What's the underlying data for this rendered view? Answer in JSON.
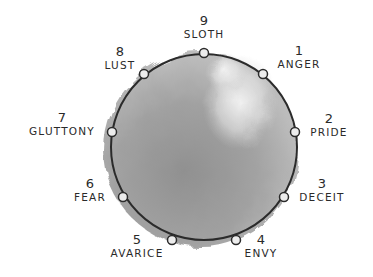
{
  "diagram": {
    "type": "enneagram-passions",
    "circle": {
      "cx": 204,
      "cy": 147,
      "r": 93,
      "stroke": "#2b2b2b",
      "wash_dark": "#8e8e8e",
      "wash_light": "#f2f2f2"
    },
    "points": [
      {
        "num": "9",
        "label": "SLOTH",
        "x": 204,
        "y": 53
      },
      {
        "num": "1",
        "label": "ANGER",
        "x": 263,
        "y": 74
      },
      {
        "num": "2",
        "label": "PRIDE",
        "x": 295,
        "y": 132
      },
      {
        "num": "3",
        "label": "DECEIT",
        "x": 284,
        "y": 197
      },
      {
        "num": "4",
        "label": "ENVY",
        "x": 236,
        "y": 240
      },
      {
        "num": "5",
        "label": "AVARICE",
        "x": 172,
        "y": 240
      },
      {
        "num": "6",
        "label": "FEAR",
        "x": 123,
        "y": 197
      },
      {
        "num": "7",
        "label": "GLUTTONY",
        "x": 112,
        "y": 132
      },
      {
        "num": "8",
        "label": "LUST",
        "x": 144,
        "y": 74
      }
    ]
  }
}
